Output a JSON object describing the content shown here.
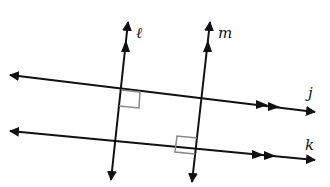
{
  "diagram": {
    "colors": {
      "line": "#111111",
      "right_angle_mark": "#888888",
      "background": "#ffffff"
    },
    "lines": [
      {
        "id": "j",
        "label": "j",
        "type": "parallel",
        "x1": 10,
        "y1": 75,
        "x2": 315,
        "y2": 112,
        "parallel_marks": 2
      },
      {
        "id": "k",
        "label": "k",
        "type": "parallel",
        "x1": 10,
        "y1": 131,
        "x2": 315,
        "y2": 160,
        "parallel_marks": 2
      },
      {
        "id": "l",
        "label": "ℓ",
        "type": "transversal",
        "x1": 128,
        "y1": 22,
        "x2": 111,
        "y2": 180,
        "parallel_marks": 1
      },
      {
        "id": "m",
        "label": "m",
        "type": "transversal",
        "x1": 210,
        "y1": 22,
        "x2": 192,
        "y2": 182,
        "parallel_marks": 1
      }
    ],
    "labels": {
      "l": "ℓ",
      "m": "m",
      "j": "j",
      "k": "k"
    },
    "right_angles": [
      {
        "at": "l ∩ j",
        "x": 121,
        "y": 90,
        "quadrant": "below-right"
      },
      {
        "at": "m ∩ k",
        "x": 195,
        "y": 154,
        "quadrant": "above-left"
      }
    ]
  }
}
